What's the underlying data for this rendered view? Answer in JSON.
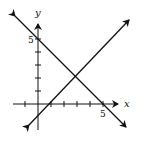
{
  "axes": {
    "x_label": "x",
    "y_label": "y",
    "x_tick_label": "5",
    "y_tick_label": "5"
  },
  "lines": [
    {
      "name": "decreasing-line",
      "equation": "y = 5 - x"
    },
    {
      "name": "increasing-line",
      "equation": "y = x - 1"
    }
  ],
  "intersection": {
    "x": 3,
    "y": 2
  }
}
